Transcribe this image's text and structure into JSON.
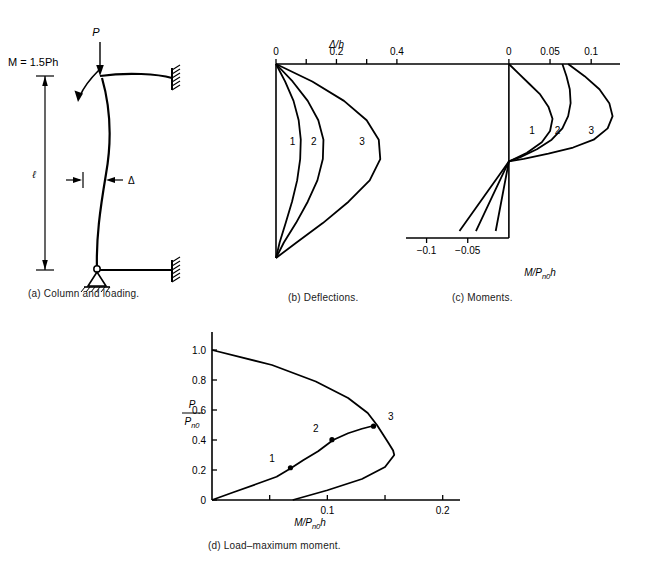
{
  "figure": {
    "panels": [
      {
        "id": "a",
        "caption": "(a)  Column and loading."
      },
      {
        "id": "b",
        "caption": "(b)  Deflections."
      },
      {
        "id": "c",
        "caption": "(c)  Moments."
      },
      {
        "id": "d",
        "caption": "(d)  Load–maximum moment."
      }
    ],
    "line_color": "#000000"
  },
  "panel_a": {
    "load_label": "P",
    "moment_label": "M = 1.5Ph",
    "length_label": "ℓ",
    "deflection_label": "Δ",
    "supports": {
      "bottom": "pinned-support",
      "top_right": "fixed-support",
      "bottom_right": "fixed-support"
    }
  },
  "chart_data": [
    {
      "id": "b",
      "type": "line",
      "title": "",
      "xlabel": "Δ/h",
      "ylabel": "",
      "xlim": [
        0,
        0.45
      ],
      "ylim": [
        0,
        1
      ],
      "xticks": [
        0,
        0.1,
        0.2,
        0.3,
        0.4
      ],
      "xticklabels": [
        "0",
        "",
        "0.2",
        "",
        "0.4"
      ],
      "grid": false,
      "axis_position": "top",
      "legend": "inline-curve-numbers",
      "series": [
        {
          "name": "1",
          "label_at": {
            "x": 0.055,
            "y": 0.42
          },
          "x": [
            0,
            0.03,
            0.058,
            0.075,
            0.082,
            0.08,
            0.07,
            0.053,
            0.032,
            0.012,
            0
          ],
          "y": [
            0,
            0.09,
            0.19,
            0.29,
            0.39,
            0.49,
            0.6,
            0.71,
            0.82,
            0.92,
            1.0
          ]
        },
        {
          "name": "2",
          "label_at": {
            "x": 0.125,
            "y": 0.42
          },
          "x": [
            0,
            0.055,
            0.105,
            0.14,
            0.157,
            0.155,
            0.137,
            0.105,
            0.066,
            0.026,
            0
          ],
          "y": [
            0,
            0.09,
            0.19,
            0.29,
            0.39,
            0.49,
            0.6,
            0.71,
            0.82,
            0.92,
            1.0
          ]
        },
        {
          "name": "3",
          "label_at": {
            "x": 0.285,
            "y": 0.42
          },
          "x": [
            0,
            0.12,
            0.225,
            0.3,
            0.34,
            0.345,
            0.31,
            0.24,
            0.155,
            0.068,
            0
          ],
          "y": [
            0,
            0.09,
            0.19,
            0.29,
            0.39,
            0.49,
            0.6,
            0.71,
            0.82,
            0.92,
            1.0
          ]
        }
      ]
    },
    {
      "id": "c",
      "type": "line",
      "title": "",
      "xlabel": "M/Pₙ₀h",
      "xlabel_parts": {
        "main": "M/P",
        "sub": "n0",
        "tail": "h"
      },
      "ylabel": "",
      "xlim": [
        -0.125,
        0.135
      ],
      "ylim": [
        0,
        1
      ],
      "xticks": [
        -0.1,
        -0.05,
        0,
        0.05,
        0.1
      ],
      "xticklabels": [
        "−0.1",
        "−0.05",
        "0",
        "0.05",
        "0.1"
      ],
      "grid": false,
      "axis_position": "top-and-bottom",
      "zero_axis": true,
      "legend": "inline-curve-numbers",
      "series": [
        {
          "name": "1",
          "label_at": {
            "x": 0.028,
            "y": 0.4
          },
          "x": [
            0.0,
            0.012,
            0.025,
            0.038,
            0.048,
            0.053,
            0.05,
            0.04,
            0.022,
            0.0,
            -0.03,
            -0.06
          ],
          "y": [
            0.0,
            0.055,
            0.115,
            0.175,
            0.245,
            0.315,
            0.385,
            0.45,
            0.51,
            0.56,
            0.76,
            0.96
          ]
        },
        {
          "name": "2",
          "label_at": {
            "x": 0.059,
            "y": 0.4
          },
          "x": [
            0.065,
            0.07,
            0.074,
            0.075,
            0.072,
            0.065,
            0.052,
            0.034,
            0.014,
            0.0,
            -0.02,
            -0.04
          ],
          "y": [
            0.0,
            0.07,
            0.145,
            0.225,
            0.3,
            0.37,
            0.435,
            0.49,
            0.535,
            0.56,
            0.76,
            0.96
          ]
        },
        {
          "name": "3",
          "label_at": {
            "x": 0.1,
            "y": 0.4
          },
          "x": [
            0.072,
            0.092,
            0.11,
            0.122,
            0.126,
            0.12,
            0.103,
            0.078,
            0.048,
            0.018,
            0.0,
            -0.008,
            -0.016
          ],
          "y": [
            0.0,
            0.07,
            0.145,
            0.225,
            0.3,
            0.37,
            0.435,
            0.48,
            0.515,
            0.545,
            0.56,
            0.76,
            0.96
          ]
        }
      ]
    },
    {
      "id": "d",
      "type": "line",
      "title": "",
      "xlabel": "M/Pₙ₀h",
      "xlabel_parts": {
        "main": "M/P",
        "sub": "n0",
        "tail": "h"
      },
      "ylabel": "P/Pₙ₀",
      "ylabel_parts": {
        "num": "P",
        "den_main": "P",
        "den_sub": "n0"
      },
      "xlim": [
        0,
        0.215
      ],
      "ylim": [
        0,
        1.08
      ],
      "xticks": [
        0,
        0.05,
        0.1,
        0.15,
        0.2
      ],
      "xticklabels": [
        "0",
        "",
        "0.1",
        "",
        "0.2"
      ],
      "yticks": [
        0,
        0.2,
        0.4,
        0.6,
        0.8,
        1.0
      ],
      "yticklabels": [
        "0",
        "0.2",
        "0.4",
        "0.6",
        "0.8",
        "1.0"
      ],
      "grid": false,
      "curves": [
        {
          "name": "interaction-envelope",
          "x": [
            0.0,
            0.052,
            0.09,
            0.118,
            0.135,
            0.143,
            0.148,
            0.153,
            0.157,
            0.158,
            0.15,
            0.13,
            0.1,
            0.07
          ],
          "y": [
            1.0,
            0.9,
            0.79,
            0.68,
            0.58,
            0.5,
            0.44,
            0.38,
            0.33,
            0.3,
            0.22,
            0.14,
            0.065,
            0.0
          ]
        },
        {
          "name": "load-path",
          "x": [
            0.0,
            0.018,
            0.038,
            0.056,
            0.068,
            0.079,
            0.092,
            0.105,
            0.118,
            0.13,
            0.14
          ],
          "y": [
            0.0,
            0.05,
            0.105,
            0.155,
            0.21,
            0.265,
            0.325,
            0.4,
            0.445,
            0.475,
            0.495
          ]
        }
      ],
      "markers": [
        {
          "label": "1",
          "x": 0.068,
          "y": 0.215,
          "label_at": {
            "x": 0.052,
            "y": 0.255
          }
        },
        {
          "label": "2",
          "x": 0.104,
          "y": 0.402,
          "label_at": {
            "x": 0.09,
            "y": 0.452
          }
        },
        {
          "label": "3",
          "x": 0.14,
          "y": 0.492,
          "label_at": {
            "x": 0.155,
            "y": 0.535
          }
        }
      ]
    }
  ]
}
